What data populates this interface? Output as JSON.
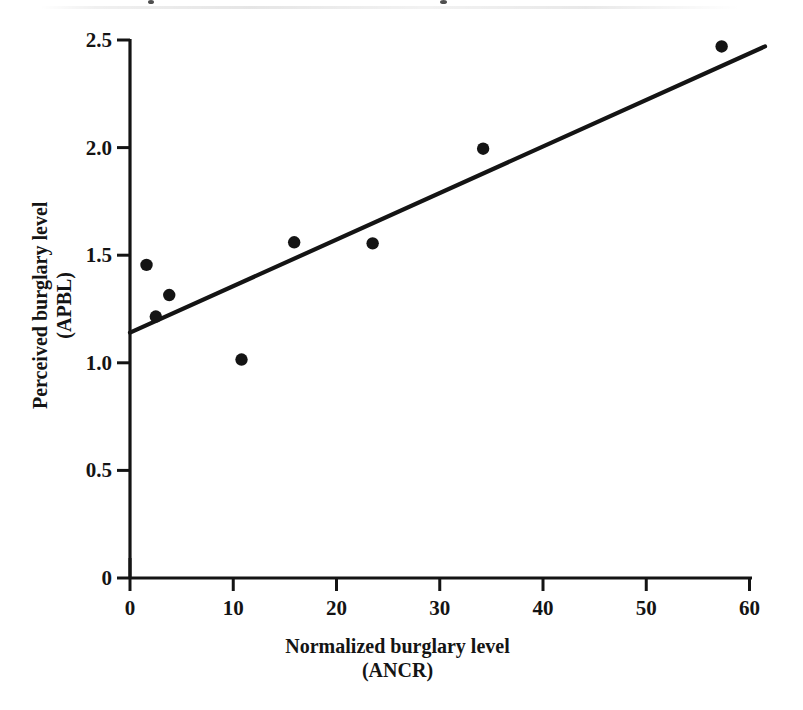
{
  "chart_data": {
    "type": "scatter",
    "title": "",
    "xlabel": "Normalized burglary level (ANCR)",
    "ylabel": "Perceived burglary level (APBL)",
    "xlabel_lines": [
      "Normalized burglary level",
      "(ANCR)"
    ],
    "ylabel_lines": [
      "Perceived burglary level",
      "(APBL)"
    ],
    "xlim": [
      0,
      61.5
    ],
    "ylim": [
      0,
      2.5
    ],
    "xticks": [
      0,
      10,
      20,
      30,
      40,
      50,
      60
    ],
    "xtick_labels": [
      "0",
      "10",
      "20",
      "30",
      "40",
      "50",
      "60"
    ],
    "yticks": [
      0,
      0.5,
      1.0,
      1.5,
      2.0,
      2.5
    ],
    "ytick_labels": [
      "0",
      "0.5",
      "1.0",
      "1.5",
      "2.0",
      "2.5"
    ],
    "grid": false,
    "legend": null,
    "legend_position": "none",
    "axis_style": "left-and-bottom-spines-with-outward-ticks",
    "marker": "filled-circle",
    "marker_color": "#141414",
    "line_color": "#141414",
    "points": [
      {
        "x": 1.6,
        "y": 1.455
      },
      {
        "x": 2.5,
        "y": 1.215
      },
      {
        "x": 3.8,
        "y": 1.315
      },
      {
        "x": 10.8,
        "y": 1.015
      },
      {
        "x": 15.9,
        "y": 1.56
      },
      {
        "x": 23.5,
        "y": 1.555
      },
      {
        "x": 34.2,
        "y": 1.995
      },
      {
        "x": 57.3,
        "y": 2.47
      }
    ],
    "series": [
      {
        "name": "Observations",
        "type": "scatter",
        "x": [
          1.6,
          2.5,
          3.8,
          10.8,
          15.9,
          23.5,
          34.2,
          57.3
        ],
        "values": [
          1.455,
          1.215,
          1.315,
          1.015,
          1.56,
          1.555,
          1.995,
          2.47
        ]
      },
      {
        "name": "Fitted regression line",
        "type": "line",
        "x": [
          0,
          61.5
        ],
        "values": [
          1.14,
          2.47
        ]
      }
    ],
    "fit_line": {
      "x_start": 0,
      "y_start": 1.14,
      "x_end": 61.5,
      "y_end": 2.47,
      "intercept": 1.14,
      "slope": 0.0216
    },
    "colors": {
      "marker": "#141414",
      "line": "#141414",
      "axis": "#141414",
      "background": "#ffffff"
    }
  }
}
